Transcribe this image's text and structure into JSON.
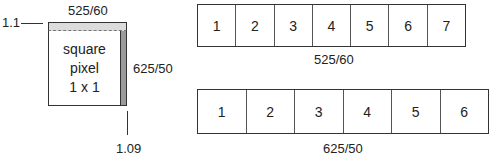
{
  "pixel_diagram": {
    "top_label": "525/60",
    "right_label": "625/50",
    "left_label": "1.1",
    "bottom_label": "1.09",
    "center_text": [
      "square",
      "pixel",
      "1 x 1"
    ]
  },
  "rows": [
    {
      "label": "525/60",
      "cells": [
        "1",
        "2",
        "3",
        "4",
        "5",
        "6",
        "7"
      ]
    },
    {
      "label": "625/50",
      "cells": [
        "1",
        "2",
        "3",
        "4",
        "5",
        "6"
      ]
    }
  ],
  "colors": {
    "top_band": "#dcdcdc",
    "right_band": "#9a9a9a",
    "line": "#333333"
  }
}
